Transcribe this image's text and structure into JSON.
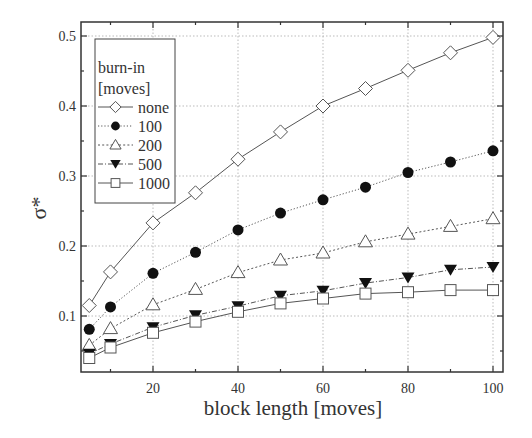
{
  "chart_data": {
    "type": "line",
    "title": "",
    "xlabel": "block length [moves]",
    "ylabel": "σ*",
    "xlim": [
      3,
      102.4
    ],
    "ylim": [
      0.02,
      0.52
    ],
    "xticks": [
      20,
      40,
      60,
      80,
      100
    ],
    "xminor": [
      10,
      30,
      50,
      70,
      90
    ],
    "yticks": [
      0.1,
      0.2,
      0.3,
      0.4,
      0.5
    ],
    "yminor": [
      0.05,
      0.15,
      0.25,
      0.35,
      0.45
    ],
    "ytick_labels": [
      "0.1",
      "0.2",
      "0.3",
      "0.4",
      "0.5"
    ],
    "xtick_labels": [
      "20",
      "40",
      "60",
      "80",
      "100"
    ],
    "grid": true,
    "legend": {
      "position": "upper left",
      "title_line1": "burn-in",
      "title_line2": "[moves]"
    },
    "x": [
      5,
      10,
      20,
      30,
      40,
      50,
      60,
      70,
      80,
      90,
      100
    ],
    "series": [
      {
        "name": "none",
        "marker": "diamond-open",
        "line": "solid",
        "values": [
          0.115,
          0.163,
          0.233,
          0.276,
          0.324,
          0.363,
          0.4,
          0.425,
          0.451,
          0.476,
          0.498
        ]
      },
      {
        "name": "100",
        "marker": "circle-filled",
        "line": "dotted",
        "values": [
          0.081,
          0.113,
          0.161,
          0.191,
          0.223,
          0.247,
          0.266,
          0.284,
          0.305,
          0.32,
          0.336
        ]
      },
      {
        "name": "200",
        "marker": "triangle-up-open",
        "line": "short-dash",
        "values": [
          0.058,
          0.082,
          0.116,
          0.138,
          0.162,
          0.18,
          0.19,
          0.206,
          0.217,
          0.228,
          0.239
        ]
      },
      {
        "name": "500",
        "marker": "triangle-down-filled",
        "line": "dash-dot",
        "values": [
          0.046,
          0.06,
          0.084,
          0.101,
          0.114,
          0.129,
          0.136,
          0.147,
          0.155,
          0.166,
          0.17
        ]
      },
      {
        "name": "1000",
        "marker": "square-open",
        "line": "solid",
        "values": [
          0.04,
          0.055,
          0.076,
          0.092,
          0.106,
          0.118,
          0.125,
          0.132,
          0.134,
          0.137,
          0.137
        ]
      }
    ]
  },
  "colors": {
    "axis": "#333333",
    "line": "#555555",
    "grid": "#aaaaaa",
    "marker_fill_dark": "#111111"
  }
}
